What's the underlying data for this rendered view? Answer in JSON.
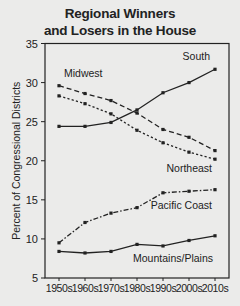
{
  "chart_data": {
    "type": "line",
    "title": "Regional Winners and Losers in the House",
    "title_lines": [
      "Regional Winners",
      "and Losers in the House"
    ],
    "xlabel": "",
    "ylabel": "Percent of Congressional Districts",
    "categories": [
      "1950s",
      "1960s",
      "1970s",
      "1980s",
      "1990s",
      "2000s",
      "2010s"
    ],
    "ylim": [
      5,
      35
    ],
    "yticks": [
      5,
      10,
      15,
      20,
      25,
      30,
      35
    ],
    "grid": false,
    "legend": "inline labels",
    "series": [
      {
        "name": "South",
        "style": "solid",
        "values": [
          24.4,
          24.4,
          24.9,
          26.5,
          28.7,
          30.0,
          31.7
        ]
      },
      {
        "name": "Midwest",
        "style": "dashed",
        "values": [
          29.6,
          28.6,
          27.7,
          26.1,
          24.0,
          23.0,
          21.3
        ]
      },
      {
        "name": "Northeast",
        "style": "dotted",
        "values": [
          28.3,
          27.3,
          26.0,
          23.9,
          22.3,
          21.1,
          20.2
        ]
      },
      {
        "name": "Pacific Coast",
        "style": "dash-dot",
        "values": [
          9.5,
          12.1,
          13.3,
          14.0,
          15.9,
          16.1,
          16.3
        ]
      },
      {
        "name": "Mountains/Plains",
        "style": "solid",
        "values": [
          8.4,
          8.2,
          8.4,
          9.3,
          9.1,
          9.8,
          10.4
        ]
      }
    ]
  }
}
